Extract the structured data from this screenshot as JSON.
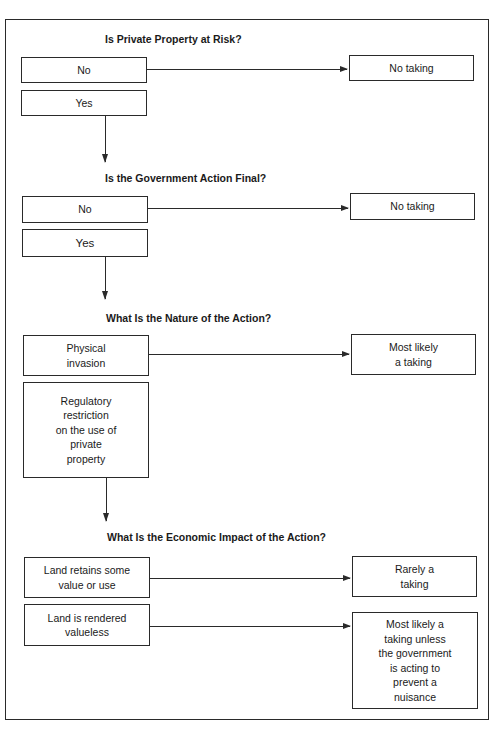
{
  "diagram": {
    "sections": [
      {
        "question": "Is Private Property at Risk?",
        "options": [
          {
            "label": "No",
            "outcome": "No taking"
          },
          {
            "label": "Yes"
          }
        ]
      },
      {
        "question": "Is the Government Action Final?",
        "options": [
          {
            "label": "No",
            "outcome": "No taking"
          },
          {
            "label": "Yes"
          }
        ]
      },
      {
        "question": "What Is the Nature of the Action?",
        "options": [
          {
            "label": "Physical\ninvasion",
            "outcome": "Most likely\na taking"
          },
          {
            "label": "Regulatory\nrestriction\non the use of\nprivate\nproperty"
          }
        ]
      },
      {
        "question": "What Is the Economic Impact of the Action?",
        "options": [
          {
            "label": "Land retains some\nvalue or use",
            "outcome": "Rarely a\ntaking"
          },
          {
            "label": "Land is rendered\nvalueless",
            "outcome": "Most likely a\ntaking unless\nthe government\nis acting to\nprevent a\nnuisance"
          }
        ]
      }
    ]
  }
}
